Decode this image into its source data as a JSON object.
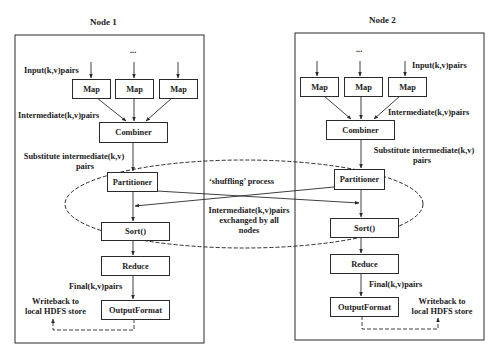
{
  "diagram": {
    "type": "mapreduce-data-flow",
    "colors": {
      "line": "#2a2a2a",
      "text": "#1c1c1c",
      "background": "#ffffff"
    }
  },
  "node1": {
    "title": "Node 1",
    "ellipsis": "...",
    "input_label": "Input(k,v)pairs",
    "maps": [
      "Map",
      "Map",
      "Map"
    ],
    "intermediate_label": "Intermediate(k,v)pairs",
    "combiner": "Combiner",
    "substitute_label_line1": "Substitute intermediate(k,v)",
    "substitute_label_line2": "pairs",
    "partitioner": "Partitioner",
    "sort": "Sort()",
    "reduce": "Reduce",
    "final_label": "Final(k,v)pairs",
    "output_format": "OutputFormat",
    "writeback_line1": "Writeback to",
    "writeback_line2": "local HDFS store"
  },
  "node2": {
    "title": "Node 2",
    "ellipsis": "...",
    "input_label": "Input(k,v)pairs",
    "maps": [
      "Map",
      "Map",
      "Map"
    ],
    "intermediate_label": "Intermediate(k,v)pairs",
    "combiner": "Combiner",
    "substitute_label_line1": "Substitute intermediate(k,v)",
    "substitute_label_line2": "pairs",
    "partitioner": "Partitioner",
    "sort": "Sort()",
    "reduce": "Reduce",
    "final_label": "Final(k,v)pairs",
    "output_format": "OutputFormat",
    "writeback_line1": "Writeback to",
    "writeback_line2": "local HDFS store"
  },
  "shuffle": {
    "title": "‘shuffling’ process",
    "exchange_line1": "Intermediate(k,v)pairs",
    "exchange_line2": "exchanged by all",
    "exchange_line3": "nodes"
  }
}
